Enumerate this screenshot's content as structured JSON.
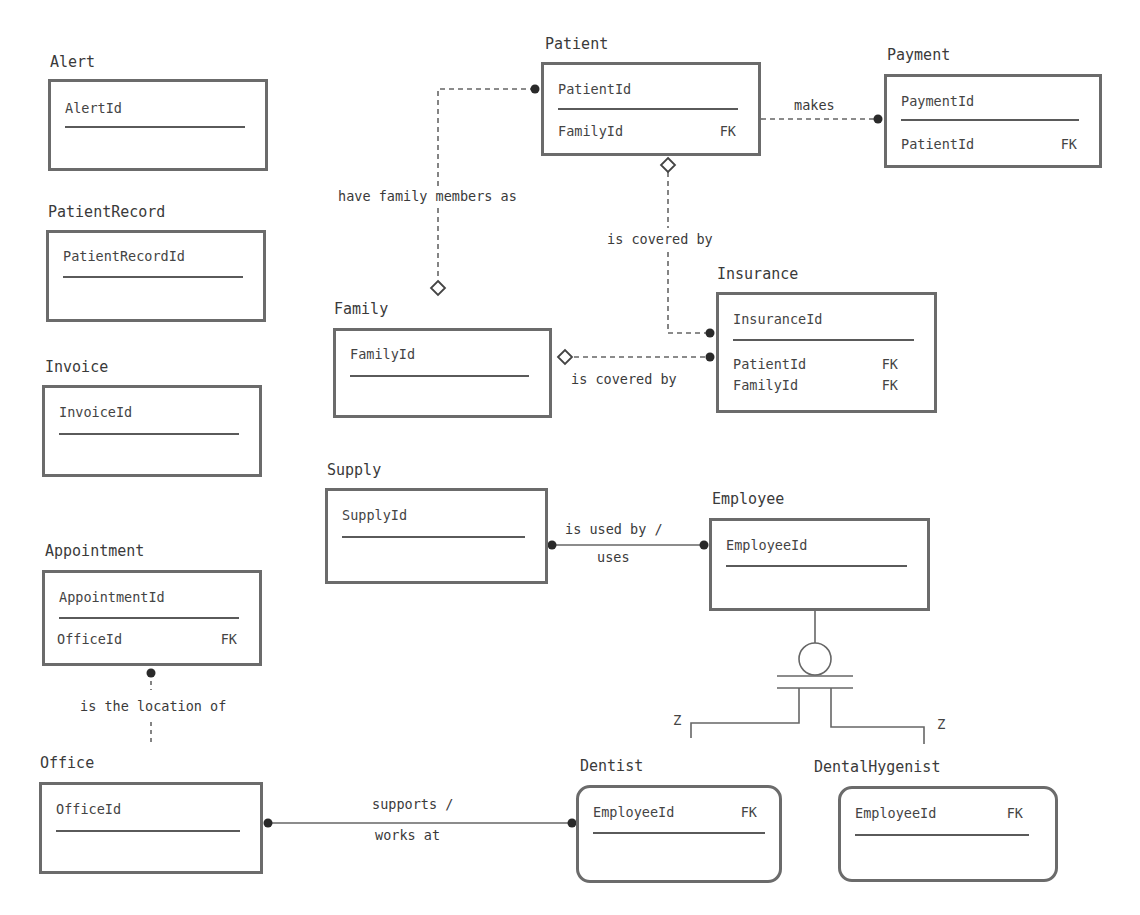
{
  "diagram": {
    "type": "entity-relationship",
    "entities": [
      {
        "id": "alert",
        "name": "Alert",
        "pk": "AlertId",
        "attributes": []
      },
      {
        "id": "patientrecord",
        "name": "PatientRecord",
        "pk": "PatientRecordId",
        "attributes": []
      },
      {
        "id": "invoice",
        "name": "Invoice",
        "pk": "InvoiceId",
        "attributes": []
      },
      {
        "id": "appointment",
        "name": "Appointment",
        "pk": "AppointmentId",
        "attributes": [
          {
            "name": "OfficeId",
            "key": "FK"
          }
        ]
      },
      {
        "id": "office",
        "name": "Office",
        "pk": "OfficeId",
        "attributes": []
      },
      {
        "id": "patient",
        "name": "Patient",
        "pk": "PatientId",
        "attributes": [
          {
            "name": "FamilyId",
            "key": "FK"
          }
        ]
      },
      {
        "id": "payment",
        "name": "Payment",
        "pk": "PaymentId",
        "attributes": [
          {
            "name": "PatientId",
            "key": "FK"
          }
        ]
      },
      {
        "id": "family",
        "name": "Family",
        "pk": "FamilyId",
        "attributes": []
      },
      {
        "id": "insurance",
        "name": "Insurance",
        "pk": "InsuranceId",
        "attributes": [
          {
            "name": "PatientId",
            "key": "FK"
          },
          {
            "name": "FamilyId",
            "key": "FK"
          }
        ]
      },
      {
        "id": "supply",
        "name": "Supply",
        "pk": "SupplyId",
        "attributes": []
      },
      {
        "id": "employee",
        "name": "Employee",
        "pk": "EmployeeId",
        "attributes": []
      },
      {
        "id": "dentist",
        "name": "Dentist",
        "pk": "EmployeeId",
        "pk_key": "FK",
        "attributes": []
      },
      {
        "id": "dentalhygenist",
        "name": "DentalHygenist",
        "pk": "EmployeeId",
        "pk_key": "FK",
        "attributes": []
      }
    ],
    "relationships": [
      {
        "from": "Patient",
        "to": "Payment",
        "label": "makes",
        "style": "dashed"
      },
      {
        "from": "Patient",
        "to": "Family",
        "label": "have family members as",
        "style": "dashed"
      },
      {
        "from": "Patient",
        "to": "Insurance",
        "label": "is covered by",
        "style": "dashed"
      },
      {
        "from": "Family",
        "to": "Insurance",
        "label": "is covered by",
        "style": "dashed"
      },
      {
        "from": "Supply",
        "to": "Employee",
        "label_line1": "is used by /",
        "label_line2": "uses",
        "style": "solid"
      },
      {
        "from": "Appointment",
        "to": "Office",
        "label": "is the location of",
        "style": "dashed"
      },
      {
        "from": "Office",
        "to": "Dentist",
        "label_line1": "supports /",
        "label_line2": "works at",
        "style": "solid"
      }
    ],
    "generalization": {
      "parent": "Employee",
      "children": [
        "Dentist",
        "DentalHygenist"
      ],
      "child_tags": [
        "Z",
        "Z"
      ]
    },
    "fk_label": "FK"
  }
}
